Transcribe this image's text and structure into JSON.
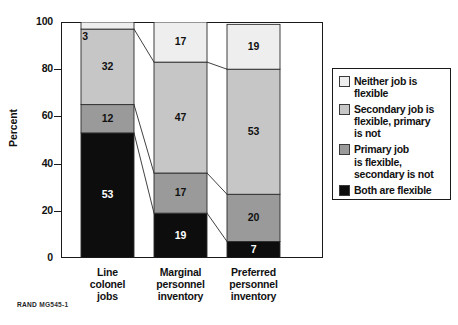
{
  "chart_data": {
    "type": "bar",
    "subtype": "stacked-bar-100",
    "title": "",
    "xlabel": "",
    "ylabel": "Percent",
    "ylim": [
      0,
      100
    ],
    "yticks": [
      0,
      20,
      40,
      60,
      80,
      100
    ],
    "grid": false,
    "legend_position": "right",
    "categories": [
      "Line colonel jobs",
      "Marginal personnel inventory",
      "Preferred personnel inventory"
    ],
    "category_lines": [
      [
        "Line",
        "colonel",
        "jobs"
      ],
      [
        "Marginal",
        "personnel",
        "inventory"
      ],
      [
        "Preferred",
        "personnel",
        "inventory"
      ]
    ],
    "series": [
      {
        "name": "Both are flexible",
        "color": "#0d0d0d",
        "label_color": "light",
        "values": [
          53,
          19,
          7
        ]
      },
      {
        "name": "Primary job is flexible, secondary is not",
        "color": "#9a9a9a",
        "label_color": "dark",
        "values": [
          12,
          17,
          20
        ]
      },
      {
        "name": "Secondary job is flexible, primary is not",
        "color": "#c6c6c6",
        "label_color": "dark",
        "values": [
          32,
          47,
          53
        ]
      },
      {
        "name": "Neither job is flexible",
        "color": "#eeeeee",
        "label_color": "dark",
        "values": [
          3,
          17,
          19
        ]
      }
    ],
    "annotations": [
      "Connector lines join matching segment boundaries between adjacent bars"
    ]
  },
  "axis": {
    "y_label": "Percent",
    "ticks": [
      "100",
      "80",
      "60",
      "40",
      "20",
      "0"
    ]
  },
  "legend": {
    "items": [
      {
        "swatch": "#eeeeee",
        "lines": [
          "Neither job is",
          "flexible"
        ]
      },
      {
        "swatch": "#c6c6c6",
        "lines": [
          "Secondary job is",
          "flexible, primary",
          "is not"
        ]
      },
      {
        "swatch": "#9a9a9a",
        "lines": [
          "Primary job",
          "is flexible,",
          "secondary is not"
        ]
      },
      {
        "swatch": "#0d0d0d",
        "lines": [
          "Both are flexible"
        ]
      }
    ]
  },
  "footer": {
    "source_prefix": "RAND",
    "source_id": "MG545-1"
  },
  "bar_labels": {
    "bar1": [
      "53",
      "12",
      "32",
      "3"
    ],
    "bar2": [
      "19",
      "17",
      "47",
      "17"
    ],
    "bar3": [
      "7",
      "20",
      "53",
      "19"
    ]
  }
}
